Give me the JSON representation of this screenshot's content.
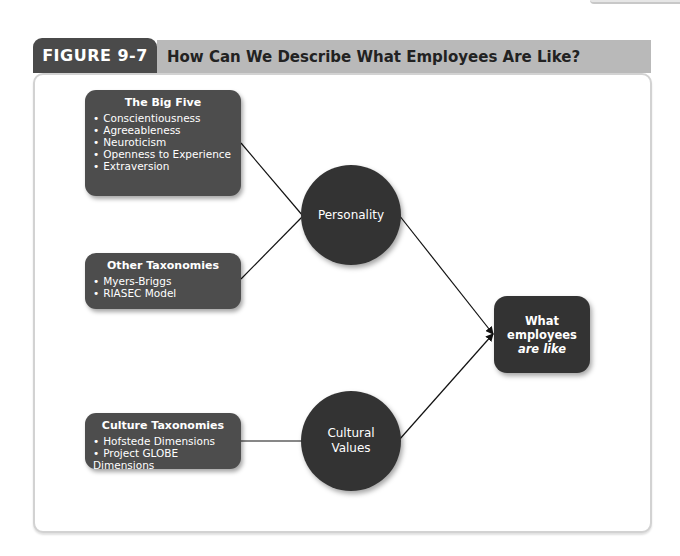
{
  "figure": {
    "label": "FIGURE 9-7",
    "title": "How Can We Describe What Employees Are Like?"
  },
  "boxes": {
    "big_five": {
      "title": "The Big Five",
      "items": [
        "Conscientiousness",
        "Agreeableness",
        "Neuroticism",
        "Openness to Experience",
        "Extraversion"
      ]
    },
    "other_taxonomies": {
      "title": "Other Taxonomies",
      "items": [
        "Myers-Briggs",
        "RIASEC Model"
      ]
    },
    "culture_taxonomies": {
      "title": "Culture Taxonomies",
      "items": [
        "Hofstede Dimensions",
        "Project GLOBE Dimensions"
      ]
    }
  },
  "nodes": {
    "personality": "Personality",
    "cultural_values_line1": "Cultural",
    "cultural_values_line2": "Values",
    "outcome_line1": "What",
    "outcome_line2": "employees",
    "outcome_line3": "are like"
  },
  "colors": {
    "tab_dark": "#4a4a4a",
    "header_band": "#b9b9b9",
    "box_fill": "#4d4d4d",
    "circle_fill": "#333333"
  }
}
